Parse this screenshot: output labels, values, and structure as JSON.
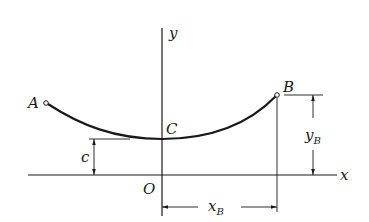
{
  "figure": {
    "type": "catenary cable diagram",
    "points": {
      "A": {
        "label": "A"
      },
      "B": {
        "label": "B"
      },
      "C": {
        "label": "C"
      },
      "O": {
        "label": "O"
      }
    },
    "axes": {
      "x_label": "x",
      "y_label": "y"
    },
    "dimensions": {
      "c": {
        "label": "c"
      },
      "yB": {
        "label": "y",
        "subscript": "B"
      },
      "xB": {
        "label": "x",
        "subscript": "B"
      }
    },
    "colors": {
      "line": "#1a1a1a",
      "background": "#ffffff"
    }
  }
}
